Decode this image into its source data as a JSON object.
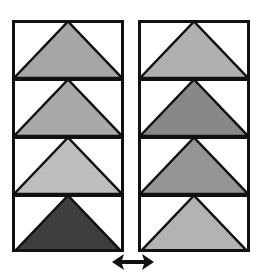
{
  "diagram": {
    "columns": [
      {
        "id": "left",
        "tiles": [
          {
            "fill": "#a6a6a6",
            "label": "light-gray triangle"
          },
          {
            "fill": "#a9a9a9",
            "label": "light-gray triangle"
          },
          {
            "fill": "#bdbdbd",
            "label": "lighter-gray triangle"
          },
          {
            "fill": "#3e3e3e",
            "label": "dark triangle"
          }
        ]
      },
      {
        "id": "right",
        "tiles": [
          {
            "fill": "#b0b0b0",
            "label": "light-gray triangle"
          },
          {
            "fill": "#888888",
            "label": "medium-gray triangle"
          },
          {
            "fill": "#959595",
            "label": "medium-gray triangle"
          },
          {
            "fill": "#b3b3b3",
            "label": "light-gray triangle"
          }
        ]
      }
    ],
    "stroke_color": "#111111",
    "arrow": {
      "icon": "double-headed-horizontal-arrow",
      "color": "#111111"
    }
  }
}
